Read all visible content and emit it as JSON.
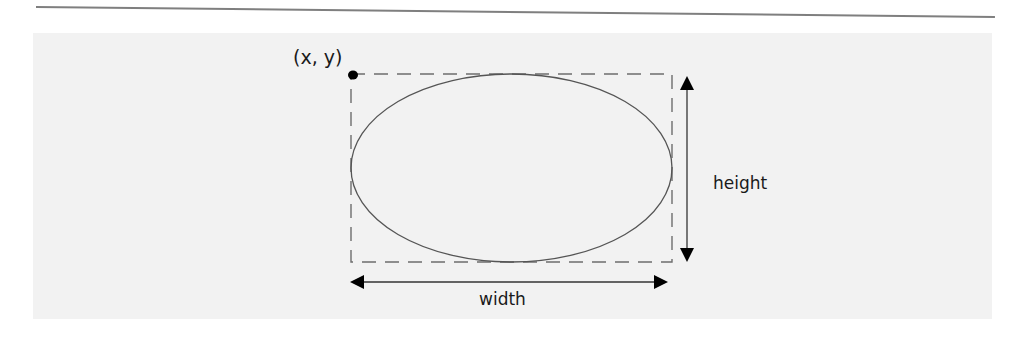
{
  "diagram": {
    "origin_label": "(x, y)",
    "height_label": "height",
    "width_label": "width",
    "colors": {
      "panel": "#f2f2f2",
      "rule": "#7f7f7f",
      "ellipse_stroke": "#555555",
      "dash_stroke": "#6e6e6e",
      "arrow": "#111111",
      "text": "#1a1a1a"
    },
    "bounding_box": {
      "x": 351,
      "y": 74,
      "width": 321,
      "height": 188
    },
    "ellipse": {
      "cx": 511.5,
      "cy": 168,
      "rx": 160.5,
      "ry": 94
    },
    "origin_point": {
      "cx": 353,
      "cy": 75,
      "r": 4.5
    },
    "height_arrow": {
      "x": 687,
      "y1": 76,
      "y2": 262
    },
    "width_arrow": {
      "y": 282,
      "x1": 350,
      "x2": 668
    }
  }
}
